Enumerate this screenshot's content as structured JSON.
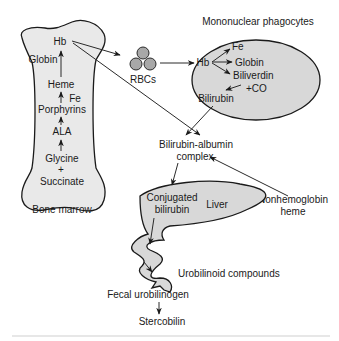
{
  "diagram": {
    "colors": {
      "shape_fill": "#d8d8d8",
      "bone_fill": "#e9e9e9",
      "rbc_fill": "#a8a8a8",
      "stroke": "#1a1a1a"
    },
    "bone_marrow": {
      "caption": "Bone marrow",
      "steps": [
        "Hb",
        "Heme",
        "Porphyrins",
        "ALA",
        "Glycine",
        "+",
        "Succinate"
      ],
      "side_inputs": {
        "globin": "Globin",
        "fe": "Fe"
      }
    },
    "rbcs": {
      "label": "RBCs"
    },
    "mononuclear_phagocytes": {
      "caption": "Mononuclear phagocytes",
      "hb": "Hb",
      "products": [
        "Fe",
        "Globin",
        "Biliverdin"
      ],
      "co": "+CO",
      "bilirubin": "Bilirubin"
    },
    "bilirubin_albumin": {
      "line1": "Bilirubin-albumin",
      "line2": "complex"
    },
    "nonhemoglobin_heme": {
      "line1": "Nonhemoglobin",
      "line2": "heme"
    },
    "liver": {
      "label": "Liver",
      "conjugated_line1": "Conjugated",
      "conjugated_line2": "bilirubin"
    },
    "intestine": {
      "urobilinoid": "Urobilinoid compounds",
      "fecal": "Fecal urobilinogen",
      "stercobilin": "Stercobilin"
    }
  }
}
